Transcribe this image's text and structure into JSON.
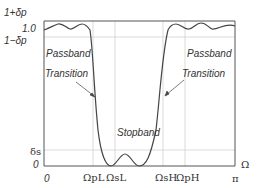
{
  "diagram": {
    "y_labels": {
      "top": "1+δp",
      "one": "1.0",
      "lower": "1−δp",
      "delta_s": "δs",
      "zero": "0"
    },
    "x_labels": {
      "zero": "0",
      "omega_pL": "ΩpL",
      "omega_sL": "ΩsL",
      "omega_sH": "ΩsH",
      "omega_pH": "ΩpH",
      "pi": "π",
      "axis": "Ω"
    },
    "regions": {
      "passband_left": "Passband",
      "passband_right": "Passband",
      "transition_left": "Transition",
      "transition_right": "Transition",
      "stopband": "Stopband"
    },
    "colors": {
      "curve": "#444444",
      "axes": "#555555",
      "grid": "#cccccc",
      "text": "#333333"
    }
  }
}
